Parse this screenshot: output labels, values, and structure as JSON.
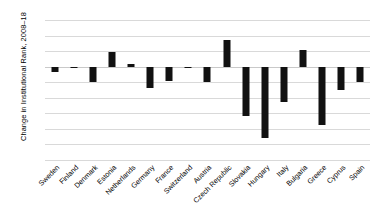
{
  "chart_data": {
    "type": "bar",
    "title": "",
    "xlabel": "",
    "ylabel": "Change in Institutional Rank, 2008–18",
    "ylim": [
      -60,
      30
    ],
    "yticks": [
      30,
      20,
      10,
      0,
      -10,
      -20,
      -30,
      -40,
      -50,
      -60
    ],
    "ytick_labels": [
      "30",
      "20",
      "10",
      "0",
      "–10",
      "–20",
      "–30",
      "–40",
      "–50",
      "–60"
    ],
    "grid": true,
    "legend": "none",
    "bar_color": "#111111",
    "gridline_color": "#d9d9d9",
    "categories": [
      "Sweden",
      "Finland",
      "Denmark",
      "Estonia",
      "Netherlands",
      "Germany",
      "France",
      "Switzerland",
      "Austria",
      "Czech Republic",
      "Slovakia",
      "Hungary",
      "Italy",
      "Bulgaria",
      "Greece",
      "Cyprus",
      "Spain"
    ],
    "values": [
      -3.5,
      -0.5,
      -10,
      9.5,
      2,
      -13.5,
      -9,
      -0.5,
      -10,
      17,
      -32,
      -46,
      -23,
      11,
      -37.5,
      -15,
      -10
    ]
  }
}
